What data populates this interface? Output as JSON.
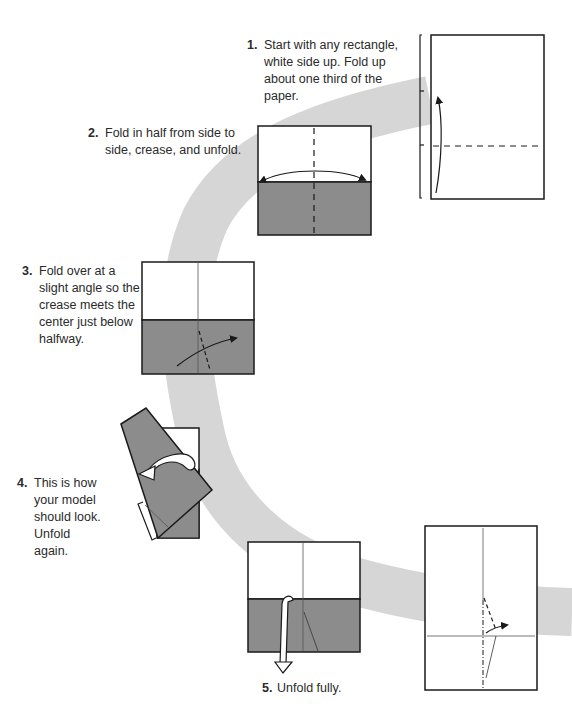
{
  "diagram": {
    "title": "",
    "colors": {
      "background": "#ffffff",
      "path_band": "#d6d6d6",
      "paper_white": "#ffffff",
      "paper_colored": "#8c8c8c",
      "outline": "#1a1a1a"
    },
    "steps": [
      {
        "number": "1.",
        "text": "Start with any rectangle, white side up. Fold up about one third of the paper."
      },
      {
        "number": "2.",
        "text": "Fold in half from side to side, crease, and unfold."
      },
      {
        "number": "3.",
        "text": "Fold over at a slight angle so the crease meets the center just below halfway."
      },
      {
        "number": "4.",
        "text": "This is how your model should look. Unfold again."
      },
      {
        "number": "5.",
        "text": "Unfold fully."
      }
    ]
  }
}
